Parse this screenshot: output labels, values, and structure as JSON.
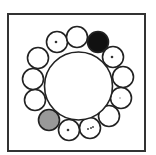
{
  "diagram": {
    "frame": {
      "stroke": "#333333"
    },
    "center_circle": {
      "cx": 78.5,
      "cy": 86,
      "r": 34,
      "fill": "#ffffff",
      "stroke": "#222222"
    },
    "small_circles": [
      {
        "cx": 57,
        "cy": 42,
        "r": 10.5,
        "fill": "#ffffff",
        "marks": "dot"
      },
      {
        "cx": 77,
        "cy": 37,
        "r": 10.5,
        "fill": "#ffffff",
        "marks": "none"
      },
      {
        "cx": 98,
        "cy": 42,
        "r": 10.5,
        "fill": "#111111",
        "marks": "none"
      },
      {
        "cx": 113,
        "cy": 57,
        "r": 10.5,
        "fill": "#ffffff",
        "marks": "dot"
      },
      {
        "cx": 123,
        "cy": 77,
        "r": 10.5,
        "fill": "#ffffff",
        "marks": "none"
      },
      {
        "cx": 121,
        "cy": 98,
        "r": 10.5,
        "fill": "#ffffff",
        "marks": "faint-dot"
      },
      {
        "cx": 109,
        "cy": 116,
        "r": 10.5,
        "fill": "#ffffff",
        "marks": "none"
      },
      {
        "cx": 90,
        "cy": 128,
        "r": 10.5,
        "fill": "#ffffff",
        "marks": "dots"
      },
      {
        "cx": 69,
        "cy": 130,
        "r": 10.5,
        "fill": "#ffffff",
        "marks": "dot"
      },
      {
        "cx": 49,
        "cy": 120,
        "r": 10.5,
        "fill": "#999999",
        "marks": "none"
      },
      {
        "cx": 35,
        "cy": 100,
        "r": 10.5,
        "fill": "#ffffff",
        "marks": "none"
      },
      {
        "cx": 33,
        "cy": 79,
        "r": 10.5,
        "fill": "#ffffff",
        "marks": "none"
      },
      {
        "cx": 38,
        "cy": 58,
        "r": 10.5,
        "fill": "#ffffff",
        "marks": "none"
      }
    ],
    "colors": {
      "black": "#111111",
      "gray": "#999999",
      "white": "#ffffff",
      "stroke": "#222222"
    }
  }
}
